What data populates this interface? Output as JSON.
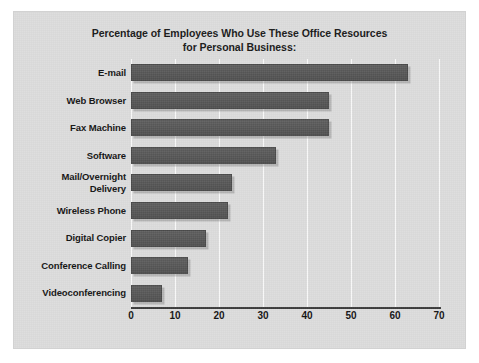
{
  "figure": {
    "background_color": "#dcdcdc",
    "bar_color": "#595959",
    "gridline_color": "#fbfbfb",
    "axis_color": "#3a3a3a",
    "text_color": "#111111"
  },
  "title": {
    "line1": "Percentage of Employees Who Use These Office Resources",
    "line2": "for Personal Business:"
  },
  "chart_data": {
    "type": "bar",
    "orientation": "horizontal",
    "title": "Percentage of Employees Who Use These Office Resources for Personal Business:",
    "xlabel": "",
    "ylabel": "",
    "xlim": [
      0,
      70
    ],
    "xticks": [
      0,
      10,
      20,
      30,
      40,
      50,
      60,
      70
    ],
    "xtick_labels": [
      "0",
      "10",
      "20",
      "30",
      "40",
      "50",
      "60",
      "70"
    ],
    "grid": true,
    "grid_axis": "x",
    "legend": false,
    "categories": [
      "E-mail",
      "Web Browser",
      "Fax Machine",
      "Software",
      "Mail/Overnight\nDelivery",
      "Wireless Phone",
      "Digital Copier",
      "Conference Calling",
      "Videoconferencing"
    ],
    "values": [
      63,
      45,
      45,
      33,
      23,
      22,
      17,
      13,
      7
    ],
    "units": "percent"
  }
}
